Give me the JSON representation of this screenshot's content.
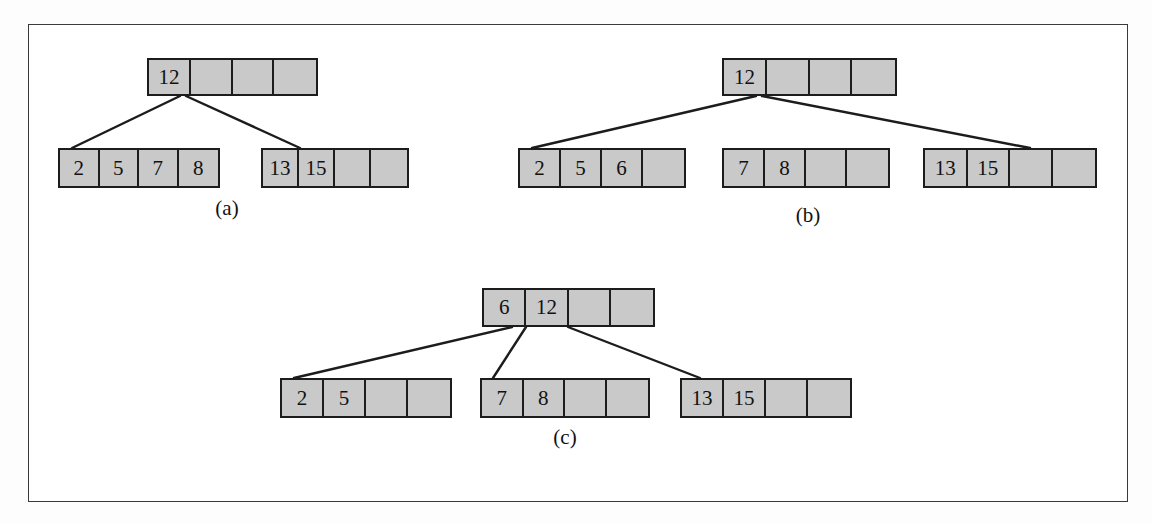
{
  "figure": {
    "caption_labels": [
      "(a)",
      "(b)",
      "(c)"
    ],
    "node_fill_color": "#c9c9c9",
    "node_border_color": "#1c1c1c",
    "edge_color": "#1c1c1c",
    "frame_border_color": "#3a3a3a",
    "background_color": "#ffffff",
    "order": 5,
    "cells_per_node": 4
  },
  "diagrams": [
    {
      "label": "(a)",
      "label_x": 227,
      "label_y": 208,
      "root": {
        "id": "a-root",
        "x": 147,
        "y": 58,
        "w": 171,
        "h": 38,
        "keys": [
          "12",
          "",
          "",
          ""
        ]
      },
      "children": [
        {
          "id": "a-leaf-1",
          "x": 58,
          "y": 148,
          "w": 162,
          "h": 40,
          "keys": [
            "2",
            "5",
            "7",
            "8"
          ]
        },
        {
          "id": "a-leaf-2",
          "x": 261,
          "y": 148,
          "w": 148,
          "h": 40,
          "keys": [
            "13",
            "15",
            "",
            ""
          ]
        }
      ],
      "edges": [
        {
          "x1": 180,
          "y1": 96,
          "x2": 72,
          "y2": 148
        },
        {
          "x1": 186,
          "y1": 96,
          "x2": 300,
          "y2": 148
        }
      ]
    },
    {
      "label": "(b)",
      "label_x": 808,
      "label_y": 215,
      "root": {
        "id": "b-root",
        "x": 722,
        "y": 58,
        "w": 175,
        "h": 38,
        "keys": [
          "12",
          "",
          "",
          ""
        ]
      },
      "children": [
        {
          "id": "b-leaf-1",
          "x": 518,
          "y": 148,
          "w": 168,
          "h": 40,
          "keys": [
            "2",
            "5",
            "6",
            ""
          ]
        },
        {
          "id": "b-leaf-2",
          "x": 722,
          "y": 148,
          "w": 168,
          "h": 40,
          "keys": [
            "7",
            "8",
            "",
            ""
          ]
        },
        {
          "id": "b-leaf-3",
          "x": 923,
          "y": 148,
          "w": 174,
          "h": 40,
          "keys": [
            "13",
            "15",
            "",
            ""
          ]
        }
      ],
      "edges": [
        {
          "x1": 756,
          "y1": 96,
          "x2": 532,
          "y2": 148
        },
        {
          "x1": 762,
          "y1": 96,
          "x2": 1030,
          "y2": 148
        }
      ]
    },
    {
      "label": "(c)",
      "label_x": 565,
      "label_y": 437,
      "root": {
        "id": "c-root",
        "x": 482,
        "y": 288,
        "w": 173,
        "h": 39,
        "keys": [
          "6",
          "12",
          "",
          ""
        ]
      },
      "children": [
        {
          "id": "c-leaf-1",
          "x": 280,
          "y": 378,
          "w": 172,
          "h": 40,
          "keys": [
            "2",
            "5",
            "",
            ""
          ]
        },
        {
          "id": "c-leaf-2",
          "x": 480,
          "y": 378,
          "w": 170,
          "h": 40,
          "keys": [
            "7",
            "8",
            "",
            ""
          ]
        },
        {
          "id": "c-leaf-3",
          "x": 680,
          "y": 378,
          "w": 172,
          "h": 40,
          "keys": [
            "13",
            "15",
            "",
            ""
          ]
        }
      ],
      "edges": [
        {
          "x1": 512,
          "y1": 327,
          "x2": 294,
          "y2": 378
        },
        {
          "x1": 526,
          "y1": 327,
          "x2": 493,
          "y2": 378
        },
        {
          "x1": 568,
          "y1": 327,
          "x2": 700,
          "y2": 378
        }
      ]
    }
  ]
}
